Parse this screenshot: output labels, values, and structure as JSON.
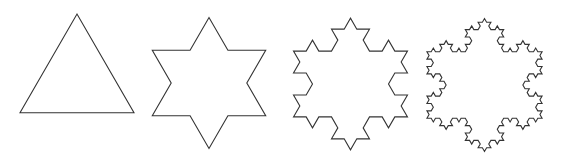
{
  "figure": {
    "stroke_color": "#333333",
    "background_color": "#ffffff",
    "shapes": [
      {
        "name": "koch-iteration-0",
        "iteration": 0,
        "description": "equilateral triangle"
      },
      {
        "name": "koch-iteration-1",
        "iteration": 1,
        "description": "six-pointed star"
      },
      {
        "name": "koch-iteration-2",
        "iteration": 2,
        "description": "second-order Koch snowflake"
      },
      {
        "name": "koch-iteration-3",
        "iteration": 3,
        "description": "third-order Koch snowflake"
      }
    ]
  }
}
